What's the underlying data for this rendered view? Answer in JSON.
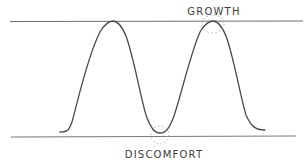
{
  "diagram": {
    "type": "hand-drawn wave diagram",
    "labels": {
      "top": "GROWTH",
      "bottom": "DISCOMFORT"
    },
    "colors": {
      "background": "#ffffff",
      "line": "#6e6e6e",
      "curve": "#4a4a4a",
      "text": "#3a3a3a",
      "highlight": "#9a9a9a"
    },
    "bounds": {
      "upper_line": "growth ceiling",
      "lower_line": "discomfort floor"
    },
    "curve": {
      "peaks": 2,
      "troughs": 1,
      "highlighted_points": [
        "second peak (growth)",
        "trough (discomfort)"
      ]
    }
  }
}
